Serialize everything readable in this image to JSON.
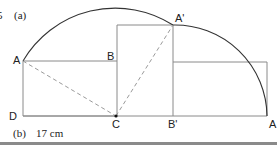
{
  "question_number": "5",
  "part_a_label": "(a)",
  "part_b_label": "(b)",
  "answer_b": "17 cm",
  "points": {
    "A": {
      "label": "A",
      "x": 23,
      "y": 61
    },
    "B": {
      "label": "B",
      "x": 117,
      "y": 61
    },
    "A_prime": {
      "label": "A'",
      "x": 173,
      "y": 25
    },
    "D": {
      "label": "D",
      "x": 22,
      "y": 116
    },
    "C": {
      "label": "C",
      "x": 116,
      "y": 116
    },
    "B_prime": {
      "label": "B'",
      "x": 173,
      "y": 116
    },
    "A_end": {
      "label": "A",
      "x": 267,
      "y": 116
    }
  },
  "colors": {
    "line": "#7a7a7a",
    "arc": "#333333",
    "dashed": "#9a9a9a",
    "text": "#222222"
  }
}
